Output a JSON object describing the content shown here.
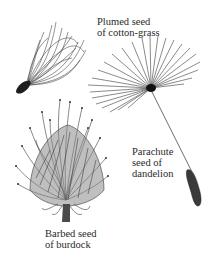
{
  "figure": {
    "items": [
      {
        "id": "cotton-grass",
        "label_lines": [
          "Plumed seed",
          "of cotton-grass"
        ]
      },
      {
        "id": "dandelion",
        "label_lines": [
          "Parachute",
          "seed of",
          "dandelion"
        ]
      },
      {
        "id": "burdock",
        "label_lines": [
          "Barbed seed",
          "of burdock"
        ]
      }
    ],
    "colors": {
      "background": "#ffffff",
      "ink": "#2a2a2a"
    }
  }
}
